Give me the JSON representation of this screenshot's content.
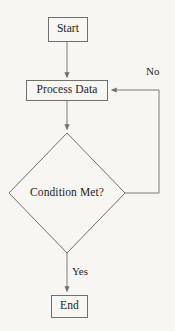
{
  "diagram": {
    "type": "flowchart",
    "background_color": "#f7f6f2",
    "stroke_color": "#7a7a78",
    "text_color": "#1c1c1c",
    "nodes": [
      {
        "id": "start",
        "label": "Start",
        "shape": "rectangle",
        "x": 48,
        "y": 17,
        "width": 40,
        "height": 25
      },
      {
        "id": "process",
        "label": "Process Data",
        "shape": "rectangle",
        "x": 26,
        "y": 80,
        "width": 82,
        "height": 21
      },
      {
        "id": "decision",
        "label": "Condition Met?",
        "shape": "diamond",
        "cx": 67,
        "cy": 193,
        "half_width": 58,
        "half_height": 60
      },
      {
        "id": "end",
        "label": "End",
        "shape": "rectangle",
        "x": 51,
        "y": 295,
        "width": 37,
        "height": 23
      }
    ],
    "edges": [
      {
        "id": "start-to-process",
        "from": "start",
        "to": "process",
        "label": "",
        "arrow": true
      },
      {
        "id": "process-to-decision",
        "from": "process",
        "to": "decision",
        "label": "",
        "arrow": true
      },
      {
        "id": "decision-to-process",
        "from": "decision",
        "to": "process",
        "label": "No",
        "arrow": true,
        "label_x": 146,
        "label_y": 66
      },
      {
        "id": "decision-to-end",
        "from": "decision",
        "to": "end",
        "label": "Yes",
        "arrow": true,
        "label_x": 72,
        "label_y": 266
      }
    ]
  }
}
